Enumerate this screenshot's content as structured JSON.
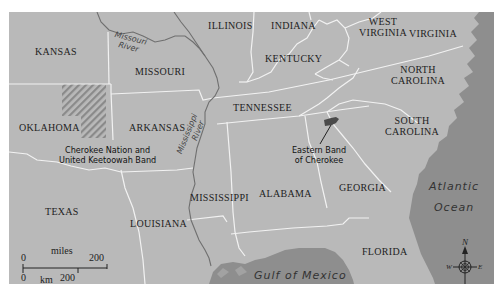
{
  "map": {
    "colors": {
      "land": "#b9b9b9",
      "water": "#8e8e8e",
      "state_border": "#f2f2f2",
      "river": "#6f6f6f",
      "territory_hatch": "#8a8a8a",
      "eastern_band_fill": "#4a4a4a",
      "text": "#222222"
    },
    "states": [
      {
        "id": "kansas",
        "label": "KANSAS"
      },
      {
        "id": "illinois",
        "label": "ILLINOIS"
      },
      {
        "id": "indiana",
        "label": "INDIANA"
      },
      {
        "id": "west-virginia",
        "label": "WEST\nVIRGINIA",
        "line1": "WEST",
        "line2": "VIRGINIA"
      },
      {
        "id": "virginia",
        "label": "VIRGINIA"
      },
      {
        "id": "missouri",
        "label": "MISSOURI"
      },
      {
        "id": "kentucky",
        "label": "KENTUCKY"
      },
      {
        "id": "north-carolina",
        "label": "NORTH\nCAROLINA",
        "line1": "NORTH",
        "line2": "CAROLINA"
      },
      {
        "id": "oklahoma",
        "label": "OKLAHOMA"
      },
      {
        "id": "arkansas",
        "label": "ARKANSAS"
      },
      {
        "id": "tennessee",
        "label": "TENNESSEE"
      },
      {
        "id": "south-carolina",
        "label": "SOUTH\nCAROLINA",
        "line1": "SOUTH",
        "line2": "CAROLINA"
      },
      {
        "id": "texas",
        "label": "TEXAS"
      },
      {
        "id": "louisiana",
        "label": "LOUISIANA"
      },
      {
        "id": "mississippi",
        "label": "MISSISSIPPI"
      },
      {
        "id": "alabama",
        "label": "ALABAMA"
      },
      {
        "id": "georgia",
        "label": "GEORGIA"
      },
      {
        "id": "florida",
        "label": "FLORIDA"
      }
    ],
    "rivers": [
      {
        "id": "missouri-river",
        "line1": "Missouri",
        "line2": "River"
      },
      {
        "id": "mississippi-river",
        "line1": "Mississippi",
        "line2": "River"
      }
    ],
    "water_bodies": [
      {
        "id": "atlantic-ocean",
        "line1": "Atlantic",
        "line2": "Ocean"
      },
      {
        "id": "gulf-of-mexico",
        "label": "Gulf of Mexico"
      }
    ],
    "callouts": [
      {
        "id": "cherokee-nation",
        "line1": "Cherokee Nation and",
        "line2": "United Keetoowah Band"
      },
      {
        "id": "eastern-band",
        "line1": "Eastern Band",
        "line2": "of Cherokee"
      }
    ],
    "scale_bar": {
      "miles_label": "miles",
      "miles_start": "0",
      "miles_end": "200",
      "km_label": "km",
      "km_start": "0",
      "km_end": "200"
    },
    "compass": {
      "north": "N",
      "south": "S",
      "east": "E",
      "west": "W"
    }
  }
}
